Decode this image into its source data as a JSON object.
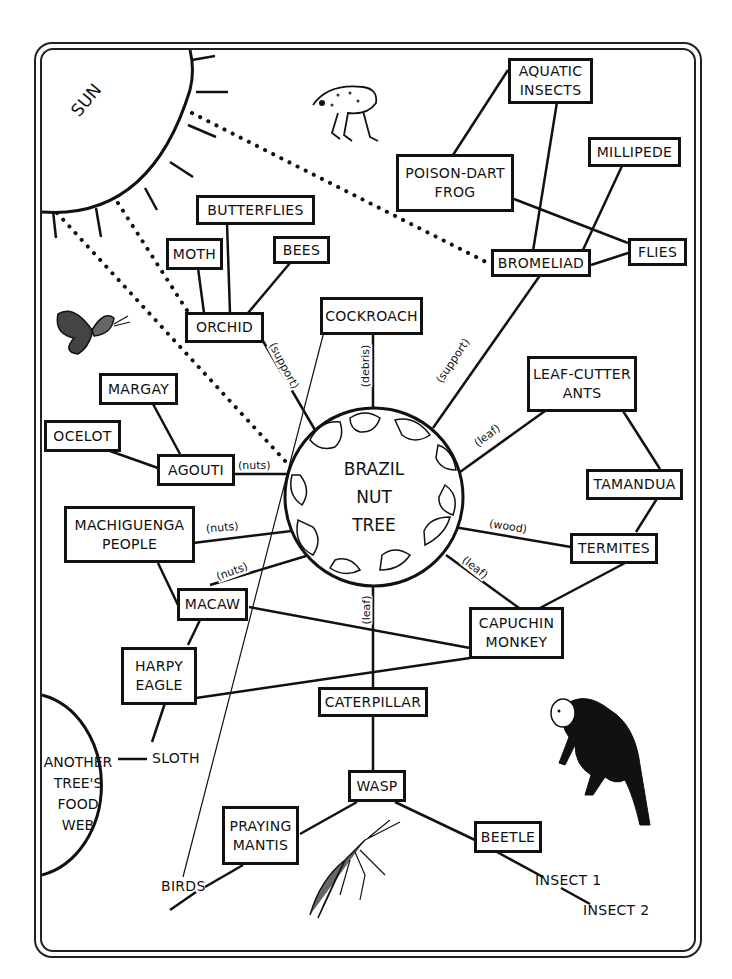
{
  "colors": {
    "ink": "#111111",
    "background": "#ffffff"
  },
  "center": {
    "label": "BRAZIL\nNUT\nTREE"
  },
  "sun": {
    "label": "SUN"
  },
  "another_web": {
    "label": "ANOTHER\nTREE'S\nFOOD\nWEB"
  },
  "nodes": {
    "aquatic_insects": "AQUATIC\nINSECTS",
    "poison_dart_frog": "POISON-DART\nFROG",
    "millipede": "MILLIPEDE",
    "bromeliad": "BROMELIAD",
    "flies": "FLIES",
    "butterflies": "BUTTERFLIES",
    "moth": "MOTH",
    "bees": "BEES",
    "orchid": "ORCHID",
    "cockroach": "COCKROACH",
    "margay": "MARGAY",
    "ocelot": "OCELOT",
    "agouti": "AGOUTI",
    "leaf_cutter_ants": "LEAF-CUTTER\nANTS",
    "tamandua": "TAMANDUA",
    "termites": "TERMITES",
    "machiguenga_people": "MACHIGUENGA\nPEOPLE",
    "macaw": "MACAW",
    "capuchin_monkey": "CAPUCHIN\nMONKEY",
    "harpy_eagle": "HARPY\nEAGLE",
    "caterpillar": "CATERPILLAR",
    "wasp": "WASP",
    "praying_mantis": "PRAYING\nMANTIS",
    "beetle": "BEETLE"
  },
  "plain_labels": {
    "sloth": "SLOTH",
    "birds": "BIRDS",
    "insect1": "INSECT 1",
    "insect2": "INSECT 2"
  },
  "edge_labels": {
    "orchid_support": "(support)",
    "cockroach_debris": "(debris)",
    "bromeliad_support": "(support)",
    "agouti_nuts": "(nuts)",
    "machiguenga_nuts": "(nuts)",
    "macaw_nuts": "(nuts)",
    "ants_leaf": "(leaf)",
    "termites_wood": "(wood)",
    "capuchin_leaf": "(leaf)",
    "caterpillar_leaf": "(leaf)"
  },
  "illustrations": [
    "frog-icon",
    "butterfly-icon",
    "monkey-icon",
    "mantis-icon"
  ]
}
